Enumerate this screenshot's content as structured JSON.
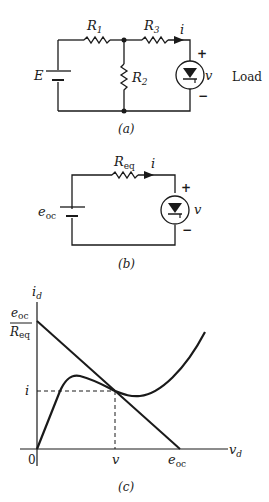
{
  "figure_a": {
    "caption": "(a)",
    "source_label": "E",
    "resistors": [
      "R",
      "R",
      "R"
    ],
    "resistor_subscripts": [
      "1",
      "3",
      "2"
    ],
    "current_label": "i",
    "voltage_label": "v",
    "plus": "+",
    "minus": "−",
    "load_label": "Load"
  },
  "figure_b": {
    "caption": "(b)",
    "source_label": "e",
    "source_subscript": "oc",
    "resistor_label": "R",
    "resistor_subscript": "eq",
    "current_label": "i",
    "voltage_label": "v",
    "plus": "+",
    "minus": "−"
  },
  "figure_c": {
    "caption": "(c)",
    "y_axis_label": "i",
    "y_axis_subscript": "d",
    "x_axis_label": "v",
    "x_axis_subscript": "d",
    "y_intercept_num": "e",
    "y_intercept_num_sub": "oc",
    "y_intercept_den": "R",
    "y_intercept_den_sub": "eq",
    "op_current": "i",
    "op_voltage": "v",
    "origin": "0",
    "x_intercept": "e",
    "x_intercept_sub": "oc"
  }
}
